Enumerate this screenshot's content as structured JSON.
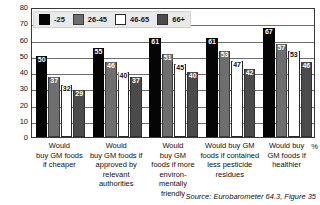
{
  "chart_data": {
    "type": "bar",
    "title": "",
    "subtitle": "",
    "xlabel": "",
    "ylabel": "%",
    "ylim": [
      0,
      80
    ],
    "ytick_step": 10,
    "yticks": [
      "80",
      "70",
      "60",
      "50",
      "40",
      "30",
      "20",
      "10",
      "0"
    ],
    "grid": true,
    "legend_position": "top-left",
    "categories": [
      "Would buy GM foods if cheaper",
      "Would buy GM foods if approved by relevant authorities",
      "Would buy GM foods if more environ-mentally friendly",
      "Would buy GM foods if contained less pesticide residues",
      "Would buy GM foods if healthier"
    ],
    "category_lines": [
      [
        "Would",
        "buy GM foods",
        "if cheaper"
      ],
      [
        "Would",
        "buy GM foods if",
        "approved by",
        "relevant authorities"
      ],
      [
        "Would",
        "buy GM",
        "foods if more",
        "environ-",
        "mentally",
        "friendly"
      ],
      [
        "Would buy GM",
        "foods if contained",
        "less pesticide",
        "residues"
      ],
      [
        "Would buy",
        "GM foods if",
        "healthier"
      ]
    ],
    "series": [
      {
        "name": "-25",
        "color": "#050505",
        "values": [
          50,
          55,
          61,
          61,
          67
        ]
      },
      {
        "name": "26-45",
        "color": "#6e6e6e",
        "values": [
          37,
          46,
          51,
          53,
          57
        ]
      },
      {
        "name": "46-65",
        "color": "#ffffff",
        "values": [
          32,
          40,
          45,
          47,
          53
        ]
      },
      {
        "name": "66+",
        "color": "#4b4b4b",
        "values": [
          29,
          37,
          40,
          42,
          46
        ]
      }
    ]
  },
  "legend": {
    "items": [
      {
        "label": "-25"
      },
      {
        "label": "26-45"
      },
      {
        "label": "46-65"
      },
      {
        "label": "66+"
      }
    ]
  },
  "axis": {
    "y_unit": "%"
  },
  "source": {
    "text": "Source: Eurobarometer 64.3, Figure 35"
  }
}
